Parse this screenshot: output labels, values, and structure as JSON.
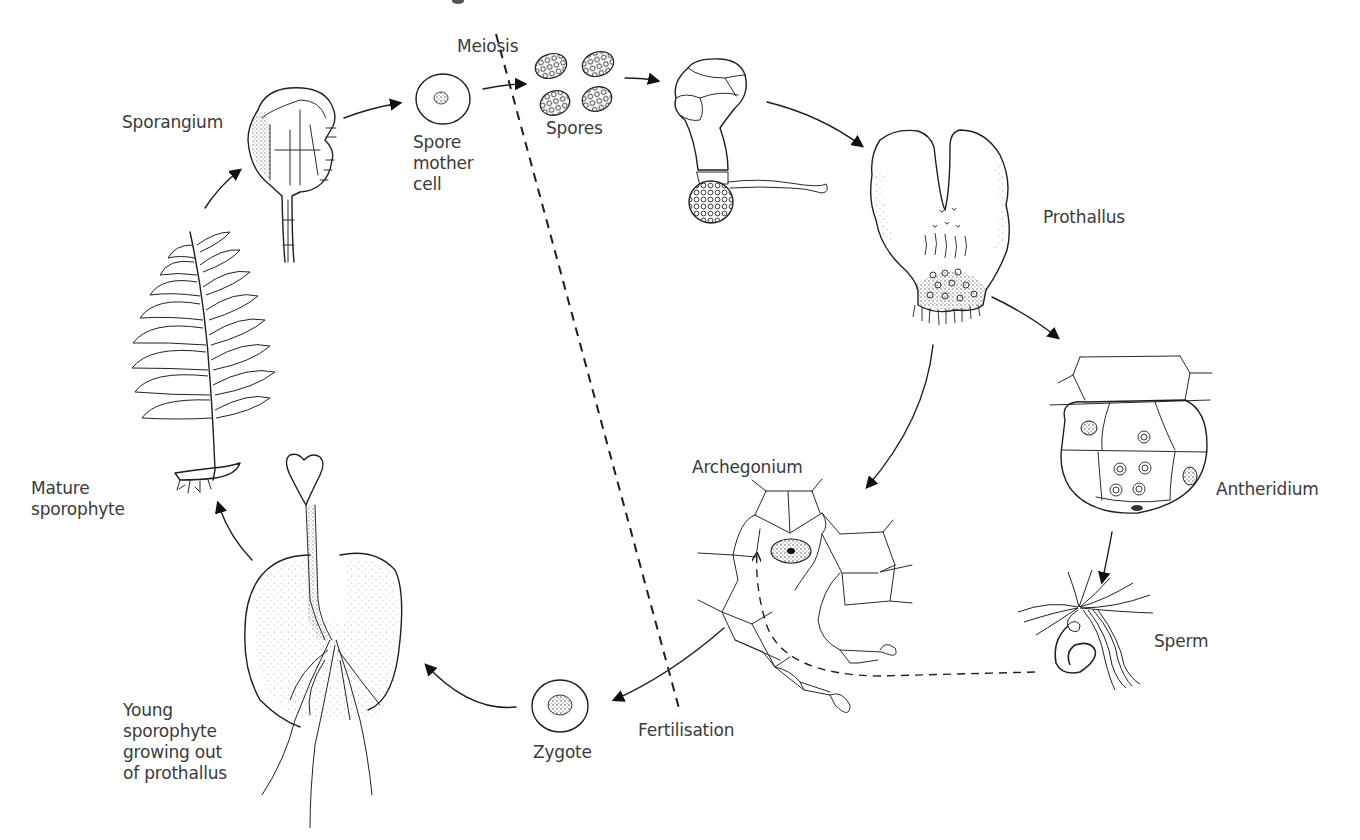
{
  "diagram": {
    "labels": {
      "meiosis": "Meiosis",
      "sporangium": "Sporangium",
      "spore_mother_cell": "Spore\nmother\ncell",
      "spores": "Spores",
      "prothallus": "Prothallus",
      "antheridium": "Antheridium",
      "sperm": "Sperm",
      "archegonium": "Archegonium",
      "fertilisation": "Fertilisation",
      "zygote": "Zygote",
      "young_sporophyte": "Young\nsporophyte\ngrowing out\nof prothallus",
      "mature_sporophyte": "Mature\nsporophyte"
    },
    "stages": [
      "Mature sporophyte",
      "Sporangium",
      "Spore mother cell",
      "Spores",
      "Germinating spore",
      "Prothallus",
      "Antheridium",
      "Sperm",
      "Archegonium",
      "Zygote",
      "Young sporophyte growing out of prothallus"
    ],
    "divider": {
      "type": "dashed line",
      "top_label": "Meiosis",
      "bottom_label": "Fertilisation"
    },
    "colors": {
      "ink": "#1e1e1e",
      "text": "#3a3a3a",
      "background": "#ffffff"
    }
  }
}
